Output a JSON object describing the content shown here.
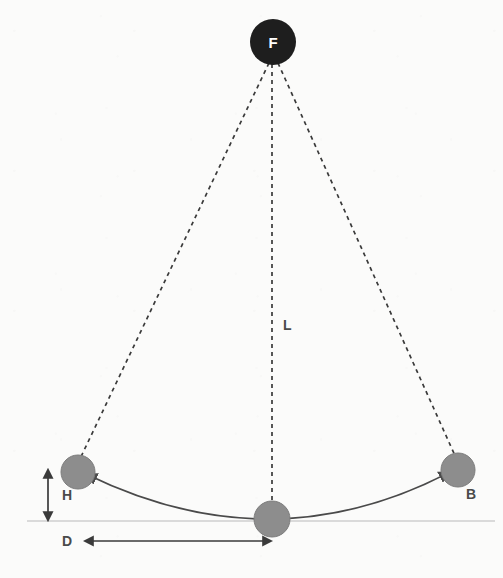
{
  "figure": {
    "type": "pendulum-diagram",
    "background_color": "#fbfbfa",
    "canvas": {
      "width": 503,
      "height": 578
    }
  },
  "labels": {
    "pivot": "F",
    "bob_right": "B",
    "length": "L",
    "height": "H",
    "displacement": "D"
  },
  "colors": {
    "pivot_fill": "#1e1e1e",
    "pivot_text": "#ffffff",
    "bob_fill": "#8d8d8d",
    "bob_stroke": "#7d7d7d",
    "dashed_line": "#3a3a3a",
    "arc_line": "#4a4a4a",
    "baseline": "#cfcfcf",
    "dimension_arrow": "#3a3a3a",
    "label_text": "#4a4a4a"
  },
  "geometry": {
    "pivot": {
      "cx": 273,
      "cy": 42,
      "r": 23
    },
    "bob_left": {
      "cx": 78,
      "cy": 472,
      "r": 17
    },
    "bob_center": {
      "cx": 272,
      "cy": 519,
      "r": 18
    },
    "bob_right": {
      "cx": 458,
      "cy": 470,
      "r": 17
    },
    "baseline": {
      "x1": 27,
      "x2": 495,
      "y": 521
    },
    "arc": {
      "start_x": 78,
      "start_y": 472,
      "end_x": 458,
      "end_y": 470,
      "lowest_y": 519
    },
    "height_arrow": {
      "x": 48,
      "y_top": 470,
      "y_bottom": 520
    },
    "displacement_arrow": {
      "y": 541,
      "x_left": 83,
      "x_right": 272
    }
  },
  "label_positions": {
    "pivot": {
      "x": 273,
      "y": 48
    },
    "bob_right": {
      "x": 466,
      "y": 499
    },
    "length": {
      "x": 283,
      "y": 330
    },
    "height": {
      "x": 62,
      "y": 500
    },
    "displacement": {
      "x": 62,
      "y": 546
    }
  },
  "elements": {
    "dashed_strings": [
      {
        "name": "string-to-left-bob",
        "x1": 269,
        "y1": 63,
        "x2": 78,
        "y2": 463
      },
      {
        "name": "string-to-center-bob",
        "x1": 272,
        "y1": 64,
        "x2": 272,
        "y2": 505
      },
      {
        "name": "string-to-right-bob",
        "x1": 278,
        "y1": 63,
        "x2": 457,
        "y2": 460
      }
    ]
  }
}
